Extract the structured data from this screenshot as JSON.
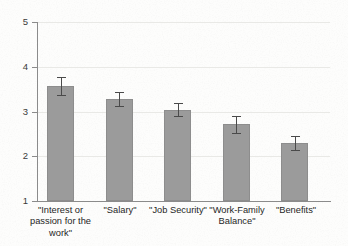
{
  "chart_data": {
    "type": "bar",
    "title": "",
    "subtitle": "",
    "xlabel": "",
    "ylabel": "",
    "ylim": [
      1,
      5
    ],
    "yticks": [
      "1",
      "2",
      "3",
      "4",
      "5"
    ],
    "grid": "horizontal",
    "legend": "none",
    "orientation": "vertical",
    "categories": [
      "\"Interest or\npassion for the\nwork\"",
      "\"Salary\"",
      "\"Job Security\"",
      "\"Work-Family\nBalance\"",
      "\"Benefits\""
    ],
    "categories_flat": [
      "\"Interest or passion for the work\"",
      "\"Salary\"",
      "\"Job Security\"",
      "\"Work-Family Balance\"",
      "\"Benefits\""
    ],
    "values": [
      3.57,
      3.28,
      3.04,
      2.72,
      2.29
    ],
    "errors": [
      0.2,
      0.16,
      0.14,
      0.19,
      0.16
    ],
    "error_type": "symmetric",
    "bar_color": "#9b9b9b",
    "bar_edge_color": "#8d8d8d",
    "error_color": "#4a4a4a",
    "axis_color": "#8b8b8b",
    "gridline_color": "#e9e9e6",
    "background_color": "#fdfdfc"
  },
  "axis": {
    "y_tick_1": "1",
    "y_tick_2": "2",
    "y_tick_3": "3",
    "y_tick_4": "4",
    "y_tick_5": "5"
  },
  "labels": {
    "cat_0": "\"Interest or\npassion for the\nwork\"",
    "cat_1": "\"Salary\"",
    "cat_2": "\"Job Security\"",
    "cat_3": "\"Work-Family\nBalance\"",
    "cat_4": "\"Benefits\""
  }
}
